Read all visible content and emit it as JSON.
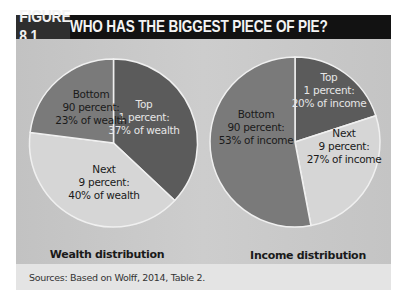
{
  "figure": {
    "number": "FIGURE 8.1",
    "title": "WHO HAS THE BIGGEST PIECE OF PIE?",
    "source": "Sources: Based on Wolff, 2014, Table 2."
  },
  "colors": {
    "title_bg": "#121212",
    "fig_num_bg": "#2e2e2e",
    "chart_bg": "#c8c8c8",
    "top_slice": "#5b5b5b",
    "next_slice": "#d6d6d6",
    "bottom_slice": "#7a7a7a",
    "slice_border": "#f0f0f0",
    "footer_bg": "#e4e4e4"
  },
  "pies": [
    {
      "caption": "Wealth distribution",
      "labels": {
        "top": [
          "Top",
          "1 percent:",
          "37% of wealth"
        ],
        "next": [
          "Next",
          "9 percent:",
          "40% of wealth"
        ],
        "bottom": [
          "Bottom",
          "90 percent:",
          "23% of wealth"
        ]
      }
    },
    {
      "caption": "Income distribution",
      "labels": {
        "top": [
          "Top",
          "1 percent:",
          "20% of income"
        ],
        "next": [
          "Next",
          "9 percent:",
          "27% of income"
        ],
        "bottom": [
          "Bottom",
          "90 percent:",
          "53% of income"
        ]
      }
    }
  ],
  "chart_data": [
    {
      "type": "pie",
      "title": "Wealth distribution",
      "categories": [
        "Top 1 percent",
        "Next 9 percent",
        "Bottom 90 percent"
      ],
      "values": [
        37,
        40,
        23
      ],
      "unit": "% of wealth",
      "start_angle": "12 o'clock",
      "direction": "clockwise",
      "legend": "none (direct labels)"
    },
    {
      "type": "pie",
      "title": "Income distribution",
      "categories": [
        "Top 1 percent",
        "Next 9 percent",
        "Bottom 90 percent"
      ],
      "values": [
        20,
        27,
        53
      ],
      "unit": "% of income",
      "start_angle": "12 o'clock",
      "direction": "clockwise",
      "legend": "none (direct labels)"
    }
  ]
}
